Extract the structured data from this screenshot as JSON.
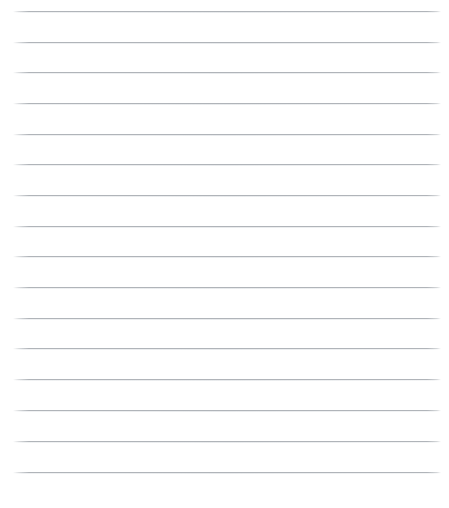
{
  "page": {
    "kind": "lined-paper-sheet",
    "width_px": 449,
    "height_px": 508,
    "background_color": "#ffffff",
    "content_text": ""
  },
  "ruling": {
    "line_color": "#b0b4b9",
    "line_shadow_color": "#dee1e4",
    "line_count": 16,
    "line_thickness_px": 1,
    "line_spacing_px": 30.7,
    "first_line_y_px": 11,
    "last_line_y_px": 472,
    "line_start_x_px": 13,
    "line_end_x_px": 441,
    "left_margin_px": 13,
    "right_margin_px": 8,
    "top_margin_px": 11,
    "bottom_margin_px": 36,
    "lines": [
      {
        "index": 1,
        "y": 11,
        "x1": 13,
        "x2": 441,
        "text": ""
      },
      {
        "index": 2,
        "y": 42,
        "x1": 13,
        "x2": 441,
        "text": ""
      },
      {
        "index": 3,
        "y": 72,
        "x1": 13,
        "x2": 441,
        "text": ""
      },
      {
        "index": 4,
        "y": 103,
        "x1": 13,
        "x2": 441,
        "text": ""
      },
      {
        "index": 5,
        "y": 134,
        "x1": 13,
        "x2": 441,
        "text": ""
      },
      {
        "index": 6,
        "y": 164,
        "x1": 13,
        "x2": 441,
        "text": ""
      },
      {
        "index": 7,
        "y": 195,
        "x1": 13,
        "x2": 441,
        "text": ""
      },
      {
        "index": 8,
        "y": 226,
        "x1": 13,
        "x2": 441,
        "text": ""
      },
      {
        "index": 9,
        "y": 256,
        "x1": 13,
        "x2": 441,
        "text": ""
      },
      {
        "index": 10,
        "y": 287,
        "x1": 13,
        "x2": 441,
        "text": ""
      },
      {
        "index": 11,
        "y": 318,
        "x1": 13,
        "x2": 441,
        "text": ""
      },
      {
        "index": 12,
        "y": 348,
        "x1": 13,
        "x2": 441,
        "text": ""
      },
      {
        "index": 13,
        "y": 379,
        "x1": 13,
        "x2": 441,
        "text": ""
      },
      {
        "index": 14,
        "y": 410,
        "x1": 13,
        "x2": 441,
        "text": ""
      },
      {
        "index": 15,
        "y": 441,
        "x1": 13,
        "x2": 441,
        "text": ""
      },
      {
        "index": 16,
        "y": 472,
        "x1": 13,
        "x2": 441,
        "text": ""
      }
    ]
  }
}
